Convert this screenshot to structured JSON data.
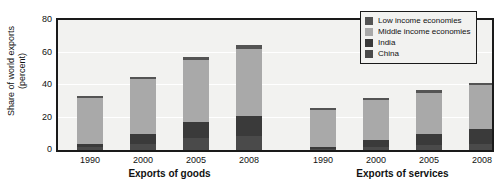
{
  "chart_data": {
    "type": "bar",
    "subtype": "stacked-grouped",
    "title": "",
    "xlabel": "",
    "ylabel": "Share of world exports\n(percent)",
    "ylim": [
      0,
      80
    ],
    "yticks": [
      0,
      20,
      40,
      60,
      80
    ],
    "grid": true,
    "legend_position": "top-right",
    "groups": [
      {
        "name": "Exports of goods",
        "categories": [
          "1990",
          "2000",
          "2005",
          "2008"
        ]
      },
      {
        "name": "Exports of services",
        "categories": [
          "1990",
          "2000",
          "2005",
          "2008"
        ]
      }
    ],
    "series": [
      {
        "name": "China",
        "color": "#4a4a4a",
        "values": [
          1.8,
          3.9,
          7.3,
          8.9,
          0.7,
          2.0,
          3.0,
          3.8
        ]
      },
      {
        "name": "India",
        "color": "#3a3a3a",
        "values": [
          2.2,
          6.1,
          10.2,
          12.3,
          1.3,
          4.2,
          6.8,
          9.0
        ]
      },
      {
        "name": "Middle income economies",
        "color": "#a9a9a9",
        "values": [
          28.0,
          33.6,
          38.0,
          41.0,
          22.5,
          24.6,
          25.0,
          27.0
        ]
      },
      {
        "name": "Low income economies",
        "color": "#545454",
        "values": [
          1.5,
          1.4,
          1.8,
          2.3,
          1.2,
          1.3,
          2.0,
          1.5
        ]
      }
    ],
    "bar_totals": [
      33.5,
      45.0,
      57.3,
      64.5,
      25.7,
      32.1,
      36.8,
      41.3
    ],
    "legend": [
      {
        "label": "Low income economies",
        "color": "#545454"
      },
      {
        "label": "Middle income economies",
        "color": "#a9a9a9"
      },
      {
        "label": "India",
        "color": "#3a3a3a"
      },
      {
        "label": "China",
        "color": "#4a4a4a"
      }
    ],
    "colors": {
      "plot_background": "#f2f2f0",
      "axis": "#1a1a1a",
      "gridline": "#ffffff",
      "text": "#111111"
    }
  }
}
